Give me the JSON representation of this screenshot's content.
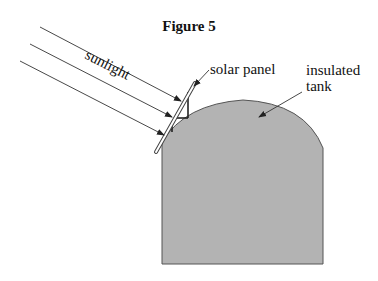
{
  "figure": {
    "title": "Figure 5",
    "labels": {
      "sunlight": "sunlight",
      "solar_panel": "solar panel",
      "tank_line1": "insulated",
      "tank_line2": "tank"
    },
    "colors": {
      "tank_fill": "#b3b3b3",
      "stroke": "#222222",
      "background": "#ffffff"
    }
  }
}
